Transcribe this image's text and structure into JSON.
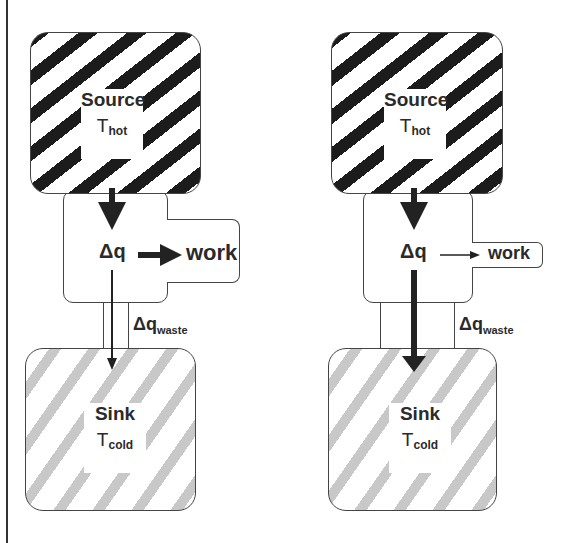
{
  "diagrams": [
    {
      "id": "left",
      "description": "Heat engine: large work output, small waste heat",
      "source": {
        "title": "Source",
        "temp_symbol": "T",
        "temp_sub": "hot"
      },
      "engine": {
        "label": "Δq"
      },
      "work": {
        "label": "work"
      },
      "waste": {
        "label": "Δq",
        "sub": "waste"
      },
      "sink": {
        "title": "Sink",
        "temp_symbol": "T",
        "temp_sub": "cold"
      }
    },
    {
      "id": "right",
      "description": "Heat engine: small work output, large waste heat",
      "source": {
        "title": "Source",
        "temp_symbol": "T",
        "temp_sub": "hot"
      },
      "engine": {
        "label": "Δq"
      },
      "work": {
        "label": "work"
      },
      "waste": {
        "label": "Δq",
        "sub": "waste"
      },
      "sink": {
        "title": "Sink",
        "temp_symbol": "T",
        "temp_sub": "cold"
      }
    }
  ],
  "colors": {
    "dark_hatch": "#1c1c1c",
    "light_hatch": "#c8c8c8",
    "line": "#444444"
  }
}
